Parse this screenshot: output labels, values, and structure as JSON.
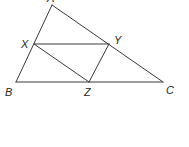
{
  "diagram": {
    "type": "triangle-with-inscribed-parallelogram",
    "stroke_color": "#3a3a3a",
    "label_color": "#2a2a2a",
    "points": {
      "A": {
        "x": 52,
        "y": 5
      },
      "B": {
        "x": 16,
        "y": 82
      },
      "C": {
        "x": 163,
        "y": 82
      },
      "X": {
        "x": 34,
        "y": 44
      },
      "Y": {
        "x": 109,
        "y": 44
      },
      "Z": {
        "x": 89,
        "y": 82
      }
    },
    "labels": {
      "A": "A",
      "B": "B",
      "C": "C",
      "X": "X",
      "Y": "Y",
      "Z": "Z"
    },
    "segments": [
      [
        "A",
        "B"
      ],
      [
        "A",
        "C"
      ],
      [
        "B",
        "C"
      ],
      [
        "X",
        "Y"
      ],
      [
        "X",
        "Z"
      ],
      [
        "Y",
        "Z"
      ]
    ]
  }
}
